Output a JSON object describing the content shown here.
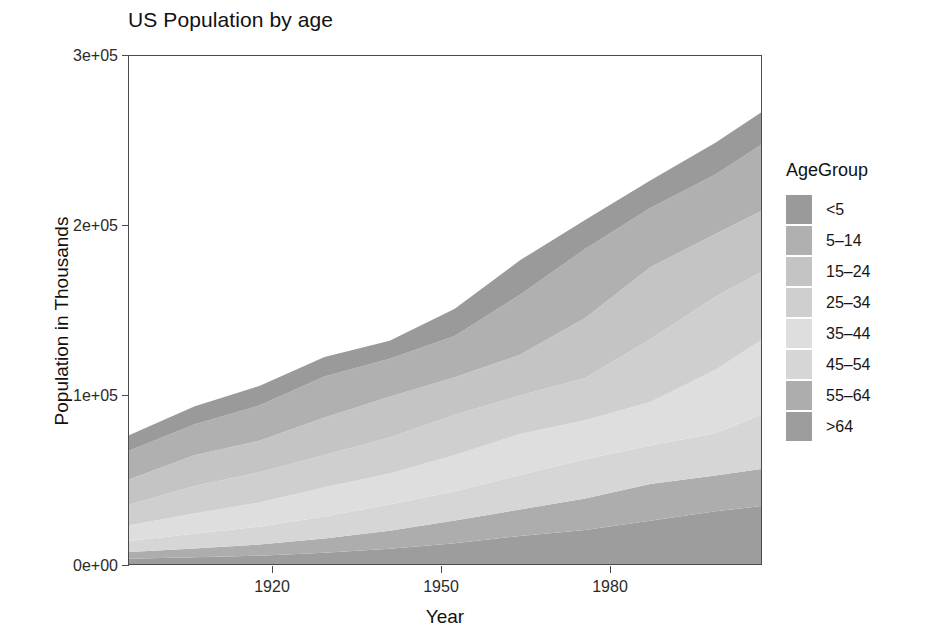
{
  "chart_data": {
    "type": "area",
    "title": "US Population by age",
    "xlabel": "Year",
    "ylabel": "Population in Thousands",
    "xlim": [
      1900,
      1997
    ],
    "ylim": [
      0,
      300000
    ],
    "xticks": [
      1920,
      1950,
      1980
    ],
    "xticklabels": [
      "1920",
      "1950",
      "1980"
    ],
    "yticks": [
      0,
      100000,
      200000,
      300000
    ],
    "yticklabels": [
      "0e+00",
      "1e+05",
      "2e+05",
      "3e+05"
    ],
    "grid": false,
    "stacked": true,
    "stack_order_bottom_to_top": [
      ">64",
      "55-64",
      "45-54",
      "35-44",
      "25-34",
      "15-24",
      "5-14",
      "<5"
    ],
    "legend": {
      "title": "AgeGroup",
      "position": "right",
      "entries": [
        "<5",
        "5–14",
        "15–24",
        "25–34",
        "35–44",
        "45–54",
        "55–64",
        ">64"
      ]
    },
    "colors": {
      "<5": "#9a9a9a",
      "5-14": "#b0b0b0",
      "15-24": "#c4c4c4",
      "25-34": "#cfcfcf",
      "35-44": "#dedede",
      "45-54": "#d6d6d6",
      "55-64": "#adadad",
      ">64": "#9d9d9d"
    },
    "x": [
      1900,
      1910,
      1920,
      1930,
      1940,
      1950,
      1960,
      1970,
      1980,
      1990,
      1997
    ],
    "series": [
      {
        "name": "<5",
        "values": [
          9181,
          10632,
          11573,
          11444,
          10541,
          16163,
          20321,
          17154,
          16348,
          18849,
          19147
        ]
      },
      {
        "name": "5-14",
        "values": [
          16967,
          18281,
          20779,
          24289,
          22431,
          24319,
          35465,
          40746,
          34942,
          35095,
          38947
        ]
      },
      {
        "name": "15-24",
        "values": [
          14951,
          18121,
          18689,
          22158,
          24033,
          22098,
          24020,
          35441,
          42487,
          37013,
          36212
        ]
      },
      {
        "name": "25-34",
        "values": [
          12161,
          16164,
          17825,
          19036,
          21339,
          23759,
          22818,
          24907,
          37082,
          43161,
          40192
        ]
      },
      {
        "name": "35-44",
        "values": [
          9273,
          12037,
          14304,
          17174,
          18333,
          21450,
          24081,
          23088,
          25635,
          37435,
          43914
        ]
      },
      {
        "name": "45-54",
        "values": [
          6437,
          8622,
          10526,
          13073,
          15512,
          17343,
          20485,
          23220,
          22800,
          25057,
          32083
        ]
      },
      {
        "name": "55-64",
        "values": [
          4027,
          5264,
          6532,
          8397,
          10572,
          13370,
          15572,
          18590,
          21703,
          21114,
          21904
        ]
      },
      {
        "name": ">64",
        "values": [
          3080,
          3950,
          4933,
          6634,
          9019,
          12270,
          16560,
          20066,
          25550,
          31084,
          34186
        ]
      }
    ],
    "totals": [
      76077,
      93012,
      105161,
      122205,
      131780,
      150772,
      179322,
      203212,
      226547,
      248808,
      266585
    ]
  }
}
